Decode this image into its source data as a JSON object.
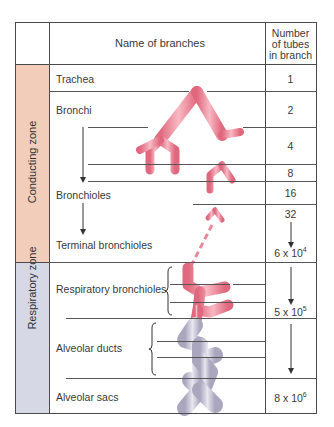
{
  "header": {
    "name_col": "Name of branches",
    "number_col_line1": "Number",
    "number_col_line2": "of tubes",
    "number_col_line3": "in branch"
  },
  "zones": [
    {
      "label": "Conducting zone",
      "color": "#f2cdb9"
    },
    {
      "label": "Respiratory zone",
      "color": "#d6d8e6"
    }
  ],
  "branches": {
    "trachea": "Trachea",
    "bronchi": "Bronchi",
    "bronchioles": "Bronchioles",
    "terminal_bronchioles": "Terminal bronchioles",
    "respiratory_bronchioles": "Respiratory bronchioles",
    "alveolar_ducts": "Alveolar ducts",
    "alveolar_sacs": "Alveolar sacs"
  },
  "counts": {
    "trachea": "1",
    "bronchi": "2",
    "gen3": "4",
    "gen4": "8",
    "gen5": "16",
    "gen6": "32",
    "terminal_base": "6 x 10",
    "terminal_exp": "4",
    "respiratory_base": "5 x 10",
    "respiratory_exp": "5",
    "sacs_base": "8 x 10",
    "sacs_exp": "6"
  },
  "colors": {
    "airway": "#e57c8e",
    "alveoli": "#c9c7d6",
    "grid": "#4a4a4a"
  }
}
